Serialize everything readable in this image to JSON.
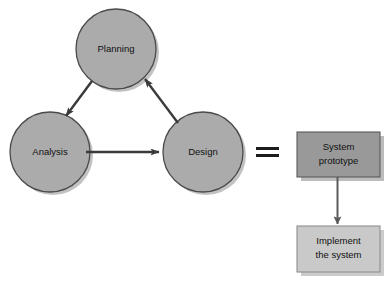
{
  "diagram": {
    "background_color": "#ffffff",
    "cycle": {
      "name": "prototyping-cycle",
      "nodes": [
        {
          "id": "planning",
          "label": "Planning",
          "shape": "circle",
          "cx": 116,
          "cy": 49,
          "r": 40,
          "fill": "#ababab",
          "stroke": "#4a4a4a"
        },
        {
          "id": "analysis",
          "label": "Analysis",
          "shape": "circle",
          "cx": 50,
          "cy": 152,
          "r": 40,
          "fill": "#ababab",
          "stroke": "#4a4a4a"
        },
        {
          "id": "design",
          "label": "Design",
          "shape": "circle",
          "cx": 203,
          "cy": 152,
          "r": 40,
          "fill": "#ababab",
          "stroke": "#4a4a4a"
        }
      ],
      "edges": [
        {
          "id": "planning-to-analysis",
          "from": "planning",
          "to": "analysis",
          "label": ""
        },
        {
          "id": "analysis-to-design",
          "from": "analysis",
          "to": "design",
          "label": ""
        },
        {
          "id": "design-to-planning",
          "from": "design",
          "to": "planning",
          "label": ""
        }
      ]
    },
    "equals": {
      "id": "equals-sign",
      "symbol": "=",
      "x": 256,
      "y": 148,
      "width": 23,
      "bar_height": 3,
      "gap": 4,
      "color": "#1c1c1c"
    },
    "outcome": {
      "name": "prototype-outcome",
      "boxes": [
        {
          "id": "system-prototype",
          "label_line1": "System",
          "label_line2": "prototype",
          "x": 297,
          "y": 132,
          "width": 83,
          "height": 45,
          "fill": "#999999",
          "stroke": "#5a5a5a"
        },
        {
          "id": "implement-the-system",
          "label_line1": "Implement",
          "label_line2": "the system",
          "x": 297,
          "y": 226,
          "width": 83,
          "height": 46,
          "fill": "#c9c9c9",
          "stroke": "#8f8f8f"
        }
      ],
      "edges": [
        {
          "id": "prototype-to-implement",
          "from": "system-prototype",
          "to": "implement-the-system",
          "label": ""
        }
      ]
    },
    "colors": {
      "circle_fill": "#ababab",
      "circle_stroke": "#4a4a4a",
      "box_fill_dark": "#999999",
      "box_fill_light": "#c9c9c9",
      "arrow": "#3a3a3a",
      "shadow": "#8c8c8c",
      "text": "#111111"
    }
  }
}
